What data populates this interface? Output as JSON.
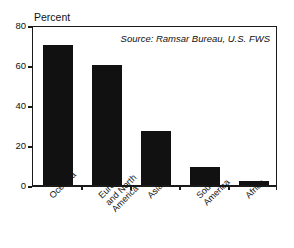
{
  "chart_data": {
    "type": "bar",
    "title": "",
    "subtitle": "",
    "xlabel": "",
    "ylabel": "Percent",
    "ylim": [
      0,
      80
    ],
    "yticks": [
      0,
      20,
      40,
      60,
      80
    ],
    "ytick_labels": [
      "0",
      "20",
      "40",
      "60",
      "80"
    ],
    "grid": false,
    "legend": false,
    "categories": [
      "Oceania",
      "Europe and North America",
      "Asia",
      "South America",
      "Africa"
    ],
    "category_label_lines": [
      [
        "Oceania"
      ],
      [
        "Europe",
        "and North",
        "America"
      ],
      [
        "Asia"
      ],
      [
        "South",
        "America"
      ],
      [
        "Africa"
      ]
    ],
    "values": [
      70,
      60,
      27,
      9,
      2
    ],
    "bar_color": "#111111",
    "annotations": [
      {
        "name": "source-note",
        "text": "Source: Ramsar Bureau, U.S. FWS",
        "style": "italic",
        "position": "top-right-inside-plot"
      }
    ]
  },
  "figure": {
    "axis_color": "#1a1a1a",
    "background": "#ffffff",
    "y_axis_label": "Percent",
    "source_text": "Source: Ramsar Bureau, U.S. FWS"
  }
}
